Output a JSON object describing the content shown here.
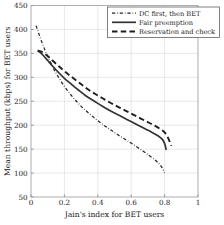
{
  "chart_data": {
    "type": "line",
    "title": "",
    "xlabel": "Jain's index for BET users",
    "ylabel": "Mean throughput (kbps) for BET users",
    "xlim": [
      0,
      1
    ],
    "ylim": [
      50,
      450
    ],
    "xticks": [
      0,
      0.2,
      0.4,
      0.6,
      0.8,
      1
    ],
    "xticklabels": [
      "0",
      "0.2",
      "0.4",
      "0.6",
      "0.8",
      "1"
    ],
    "yticks": [
      50,
      100,
      150,
      200,
      250,
      300,
      350,
      400,
      450
    ],
    "yticklabels": [
      "50",
      "100",
      "150",
      "200",
      "250",
      "300",
      "350",
      "400",
      "450"
    ],
    "grid": true,
    "legend_position": "top-right",
    "series": [
      {
        "name": "DC first, then BET",
        "style": "dashdot",
        "color": "#262626",
        "width": 1.25,
        "x": [
          0.03,
          0.045,
          0.06,
          0.08,
          0.1,
          0.13,
          0.16,
          0.2,
          0.24,
          0.28,
          0.32,
          0.37,
          0.42,
          0.47,
          0.52,
          0.57,
          0.62,
          0.67,
          0.71,
          0.75,
          0.78,
          0.8
        ],
        "y": [
          408,
          393,
          378,
          360,
          344,
          322,
          303,
          281,
          263,
          247,
          233,
          218,
          204,
          192,
          180,
          169,
          158,
          146,
          136,
          125,
          114,
          100
        ]
      },
      {
        "name": "Fair preemption",
        "style": "solid",
        "color": "#333333",
        "width": 1.7,
        "x": [
          0.04,
          0.055,
          0.075,
          0.1,
          0.13,
          0.165,
          0.2,
          0.24,
          0.285,
          0.33,
          0.38,
          0.43,
          0.48,
          0.53,
          0.58,
          0.63,
          0.68,
          0.72,
          0.76,
          0.785,
          0.8,
          0.81
        ],
        "y": [
          355,
          352,
          345,
          335,
          323,
          310,
          298,
          286,
          273,
          261,
          250,
          239,
          229,
          220,
          211,
          202,
          193,
          186,
          178,
          171,
          162,
          148
        ]
      },
      {
        "name": "Reservation and check",
        "style": "dashed",
        "color": "#1f1f1f",
        "width": 1.9,
        "x": [
          0.04,
          0.058,
          0.08,
          0.105,
          0.135,
          0.17,
          0.21,
          0.25,
          0.295,
          0.34,
          0.39,
          0.44,
          0.49,
          0.54,
          0.59,
          0.64,
          0.69,
          0.73,
          0.77,
          0.8,
          0.82,
          0.84
        ],
        "y": [
          356,
          354,
          350,
          343,
          333,
          322,
          310,
          299,
          287,
          275,
          264,
          254,
          244,
          235,
          226,
          217,
          208,
          201,
          193,
          185,
          174,
          157
        ]
      }
    ]
  },
  "legend": {
    "entries": [
      {
        "label": "DC first, then BET"
      },
      {
        "label": "Fair preemption"
      },
      {
        "label": "Reservation and check"
      }
    ]
  }
}
